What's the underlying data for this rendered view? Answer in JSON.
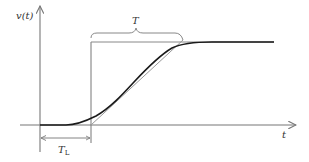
{
  "diagram": {
    "type": "step-response-with-tangent",
    "labels": {
      "y_axis": "v(t)",
      "x_axis": "t",
      "time_constant": "T",
      "lag_main": "T",
      "lag_sub": "L"
    },
    "colors": {
      "axis": "#777777",
      "curve": "#1a1a1a",
      "step": "#777777",
      "tangent": "#999999",
      "text": "#333333"
    }
  }
}
